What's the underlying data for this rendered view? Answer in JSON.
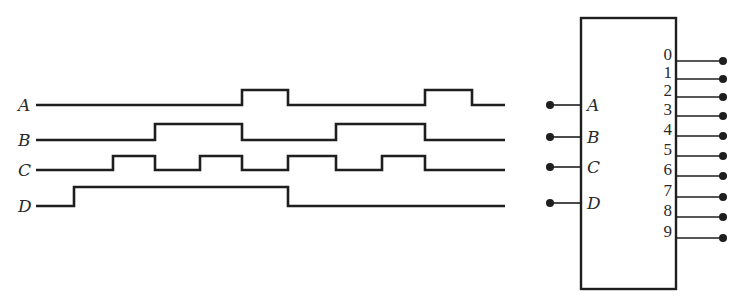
{
  "diagram": {
    "type": "timing-diagram-with-decoder-block",
    "waveforms": [
      {
        "label": "A",
        "low_y": 105,
        "high_y": 90,
        "x_start": 36,
        "x_end": 505,
        "start_level": 0,
        "transitions_x": [
          242,
          288,
          425,
          472
        ]
      },
      {
        "label": "B",
        "low_y": 140,
        "high_y": 124,
        "x_start": 36,
        "x_end": 505,
        "start_level": 0,
        "transitions_x": [
          155,
          242,
          336,
          425
        ]
      },
      {
        "label": "C",
        "low_y": 170,
        "high_y": 156,
        "x_start": 36,
        "x_end": 505,
        "start_level": 0,
        "transitions_x": [
          113,
          155,
          200,
          242,
          288,
          336,
          382,
          425
        ]
      },
      {
        "label": "D",
        "low_y": 206,
        "high_y": 187,
        "x_start": 36,
        "x_end": 505,
        "start_level": 0,
        "transitions_x": [
          74,
          288
        ]
      }
    ],
    "block": {
      "x": 581,
      "y": 18,
      "width": 95,
      "height": 271,
      "inputs": [
        {
          "label": "A",
          "y": 105
        },
        {
          "label": "B",
          "y": 137
        },
        {
          "label": "C",
          "y": 167
        },
        {
          "label": "D",
          "y": 203
        }
      ],
      "outputs": [
        {
          "label": "0",
          "y": 61
        },
        {
          "label": "1",
          "y": 79
        },
        {
          "label": "2",
          "y": 97
        },
        {
          "label": "3",
          "y": 116
        },
        {
          "label": "4",
          "y": 136
        },
        {
          "label": "5",
          "y": 156
        },
        {
          "label": "6",
          "y": 176
        },
        {
          "label": "7",
          "y": 197
        },
        {
          "label": "8",
          "y": 217
        },
        {
          "label": "9",
          "y": 238
        }
      ]
    },
    "colors": {
      "line": "#1e1e1e",
      "background": "#ffffff"
    }
  }
}
